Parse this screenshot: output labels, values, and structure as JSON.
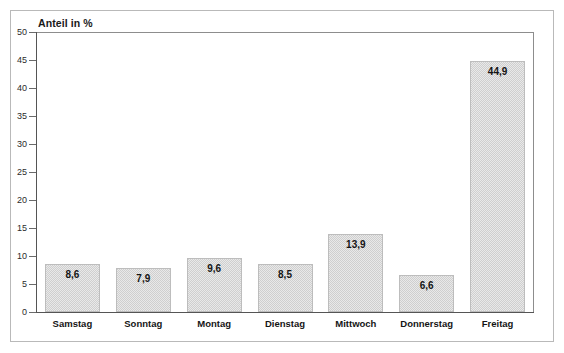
{
  "chart_data": {
    "type": "bar",
    "title": "Anteil in %",
    "xlabel": "",
    "ylabel": "Anteil in %",
    "ylim": [
      0,
      50
    ],
    "ytick_step": 5,
    "grid": false,
    "legend": "none",
    "categories": [
      "Samstag",
      "Sonntag",
      "Montag",
      "Dienstag",
      "Mittwoch",
      "Donnerstag",
      "Freitag"
    ],
    "values": [
      8.6,
      7.9,
      9.6,
      8.5,
      13.9,
      6.6,
      44.9
    ],
    "value_labels": [
      "8,6",
      "7,9",
      "9,6",
      "8,5",
      "13,9",
      "6,6",
      "44,9"
    ],
    "ytick_labels": [
      "50",
      "45",
      "40",
      "35",
      "30",
      "25",
      "20",
      "15",
      "10",
      "5",
      "0"
    ],
    "ytick_values": [
      50,
      45,
      40,
      35,
      30,
      25,
      20,
      15,
      10,
      5,
      0
    ],
    "bar_color": "#cfcfcf",
    "bar_border_color": "#bdbdbd",
    "axis_color": "#555555",
    "frame_color": "#b9b9b9"
  }
}
